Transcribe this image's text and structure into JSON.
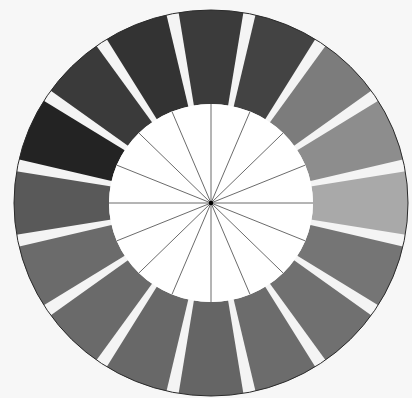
{
  "diagram": {
    "type": "color-wheel",
    "rendering": "grayscale",
    "background": "#f7f7f7",
    "center": [
      211,
      203
    ],
    "outer_radius": [
      197,
      193
    ],
    "inner_radius": [
      102,
      99
    ],
    "gap_color": "#f4f4f4",
    "outline_color": "#2a2a2a",
    "spoke_color": "#5a5a5a",
    "hub_color": "#000000",
    "segment_count": 16,
    "segments": [
      {
        "position": 1,
        "angle_center": 0,
        "fill": "#3b3b3b"
      },
      {
        "position": 2,
        "angle_center": 22.5,
        "fill": "#434343"
      },
      {
        "position": 3,
        "angle_center": 45,
        "fill": "#7c7c7c"
      },
      {
        "position": 4,
        "angle_center": 67.5,
        "fill": "#8d8d8d"
      },
      {
        "position": 5,
        "angle_center": 90,
        "fill": "#a9a9a9"
      },
      {
        "position": 6,
        "angle_center": 112.5,
        "fill": "#757575"
      },
      {
        "position": 7,
        "angle_center": 135,
        "fill": "#707070"
      },
      {
        "position": 8,
        "angle_center": 157.5,
        "fill": "#6c6c6c"
      },
      {
        "position": 9,
        "angle_center": 180,
        "fill": "#656565"
      },
      {
        "position": 10,
        "angle_center": 202.5,
        "fill": "#686868"
      },
      {
        "position": 11,
        "angle_center": 225,
        "fill": "#6a6a6a"
      },
      {
        "position": 12,
        "angle_center": 247.5,
        "fill": "#6b6b6b"
      },
      {
        "position": 13,
        "angle_center": 270,
        "fill": "#595959"
      },
      {
        "position": 14,
        "angle_center": 292.5,
        "fill": "#232323"
      },
      {
        "position": 15,
        "angle_center": 315,
        "fill": "#3a3a3a"
      },
      {
        "position": 16,
        "angle_center": 337.5,
        "fill": "#333333"
      }
    ],
    "inner_spoke_count": 16
  }
}
